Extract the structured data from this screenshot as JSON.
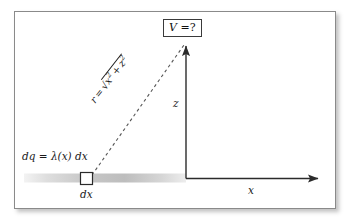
{
  "figure": {
    "background_color": "#ffffff",
    "frame_border_color": "#8a8a8a"
  },
  "annotations": {
    "potential_query": {
      "symbol": "V",
      "equals": " =",
      "value": "?",
      "full_text": "V =?"
    },
    "charge_element": {
      "full_text": "dq = λ(x) dx",
      "lhs": "dq",
      "equals": "=",
      "density": "λ(x)",
      "differential": "dx"
    },
    "distance": {
      "full_text": "r = √(x² + z²)",
      "lhs": "r",
      "equals": "=",
      "radicand_first": "x",
      "radicand_first_exp": "2",
      "plus": "+",
      "radicand_second": "z",
      "radicand_second_exp": "2"
    },
    "dx_tick": "dx"
  },
  "axes": {
    "horizontal": {
      "label": "x",
      "arrow": true,
      "color": "#2b2b2b"
    },
    "vertical": {
      "label": "z",
      "arrow": true,
      "color": "#2b2b2b"
    },
    "origin_label": ""
  },
  "elements": {
    "rod": {
      "name": "charged-rod",
      "shading": "gray-gradient",
      "color_start": "#f0f0f0",
      "color_mid": "#c9c9c9",
      "color_end": "#ededed"
    },
    "charge_square": {
      "name": "dq-square",
      "stroke": "#2b2b2b",
      "fill": "#ffffff"
    },
    "ray": {
      "name": "distance-ray",
      "style": "dashed",
      "color": "#555555"
    }
  },
  "colors": {
    "ink": "#1a1a1a",
    "axis": "#2b2b2b",
    "dash": "#555555",
    "frame": "#8a8a8a",
    "rod_gray": "#c9c9c9"
  }
}
